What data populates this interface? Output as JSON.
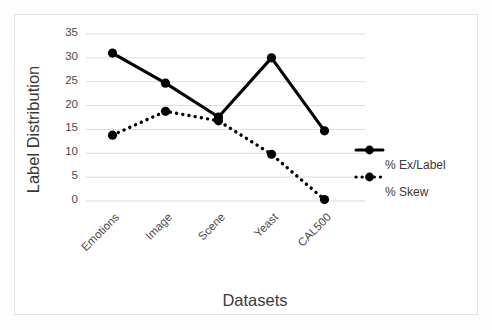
{
  "chart_data": {
    "type": "line",
    "title": "",
    "xlabel": "Datasets",
    "ylabel": "Label Distribution",
    "categories": [
      "Emotions",
      "Image",
      "Scene",
      "Yeast",
      "CAL500"
    ],
    "ylim": [
      0,
      35
    ],
    "yticks": [
      0,
      5,
      10,
      15,
      20,
      25,
      30,
      35
    ],
    "ytick_labels": [
      "0",
      "5",
      "10",
      "15",
      "20",
      "25",
      "30",
      "35"
    ],
    "grid": "horizontal",
    "legend_position": "right",
    "series": [
      {
        "name": "% Ex/Label",
        "values": [
          31.0,
          24.7,
          17.6,
          30.0,
          14.7
        ],
        "line_style": "solid",
        "marker": "circle",
        "color": "#000000"
      },
      {
        "name": "% Skew",
        "values": [
          13.8,
          18.8,
          16.8,
          9.8,
          0.3
        ],
        "line_style": "dotted",
        "marker": "circle",
        "color": "#000000"
      }
    ]
  },
  "legend": {
    "items": [
      {
        "label": "% Ex/Label"
      },
      {
        "label": "% Skew"
      }
    ]
  },
  "colors": {
    "series": "#000000",
    "gridline": "#dcdcdc",
    "frame": "#e2e2e2",
    "tick_text": "#4a4a4a",
    "axis_title_text": "#3a3a3a"
  }
}
